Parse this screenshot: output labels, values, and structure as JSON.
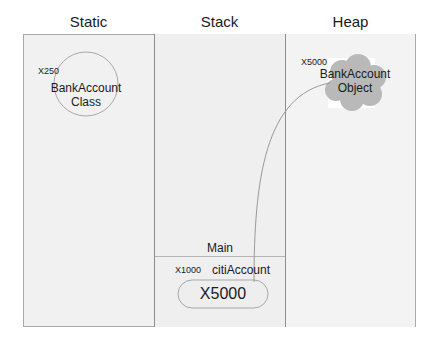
{
  "columns": [
    {
      "title": "Static"
    },
    {
      "title": "Stack"
    },
    {
      "title": "Heap"
    }
  ],
  "static": {
    "address": "X250",
    "label_line1": "BankAccount",
    "label_line2": "Class"
  },
  "stack": {
    "frame_label": "Main",
    "address": "X1000",
    "variable_name": "citiAccount",
    "value": "X5000"
  },
  "heap": {
    "address": "X5000",
    "label_line1": "BankAccount",
    "label_line2": "Object"
  },
  "colors": {
    "frame_bg": "#f1f1f1",
    "cloud_fill": "#b8b8b8",
    "line": "#9a9a9a"
  }
}
